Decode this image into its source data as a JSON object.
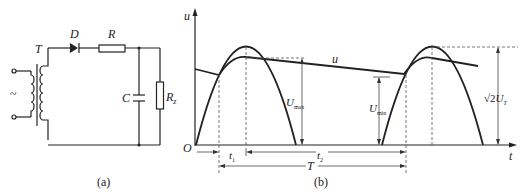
{
  "figure": {
    "subfigures": [
      {
        "id": "a",
        "caption": "(a)",
        "type": "circuit",
        "description": "Half-wave rectifier with capacitor filter",
        "components": {
          "transformer": "T",
          "diode": "D",
          "resistor": "R",
          "capacitor": "C",
          "load": "R",
          "load_sub": "z",
          "source_symbol": "~"
        }
      },
      {
        "id": "b",
        "caption": "(b)",
        "type": "waveform",
        "labels": {
          "y_axis": "u",
          "x_axis": "t",
          "origin": "O",
          "curve_label": "u",
          "u_max": "U",
          "u_max_sub": "max",
          "u_min": "U",
          "u_min_sub": "min",
          "peak_sqrt": "√2",
          "peak_U": "U",
          "peak_sub": "T",
          "t1": "t",
          "t1_sub": "1",
          "t2": "t",
          "t2_sub": "2",
          "period": "T"
        }
      }
    ]
  }
}
